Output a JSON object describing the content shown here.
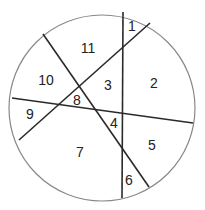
{
  "diagram": {
    "type": "circle-divided-by-lines",
    "circle": {
      "cx": 102,
      "cy": 108,
      "r": 93,
      "stroke": "#888888"
    },
    "lines": [
      {
        "id": "vertical",
        "x1": 123,
        "y1": 12,
        "x2": 122,
        "y2": 198
      },
      {
        "id": "diag-nw-se",
        "x1": 43,
        "y1": 34,
        "x2": 149,
        "y2": 187
      },
      {
        "id": "diag-ne-sw",
        "x1": 150,
        "y1": 23,
        "x2": 19,
        "y2": 140
      },
      {
        "id": "near-horizontal",
        "x1": 12,
        "y1": 98,
        "x2": 193,
        "y2": 123
      }
    ],
    "line_color": "#2a2a2a",
    "regions": [
      {
        "label": "1",
        "x": 132,
        "y": 27
      },
      {
        "label": "2",
        "x": 154,
        "y": 84
      },
      {
        "label": "3",
        "x": 108,
        "y": 86
      },
      {
        "label": "4",
        "x": 114,
        "y": 124
      },
      {
        "label": "5",
        "x": 152,
        "y": 146
      },
      {
        "label": "6",
        "x": 129,
        "y": 181
      },
      {
        "label": "7",
        "x": 80,
        "y": 153
      },
      {
        "label": "8",
        "x": 77,
        "y": 101
      },
      {
        "label": "9",
        "x": 30,
        "y": 115
      },
      {
        "label": "10",
        "x": 46,
        "y": 81
      },
      {
        "label": "11",
        "x": 88,
        "y": 49
      }
    ]
  }
}
